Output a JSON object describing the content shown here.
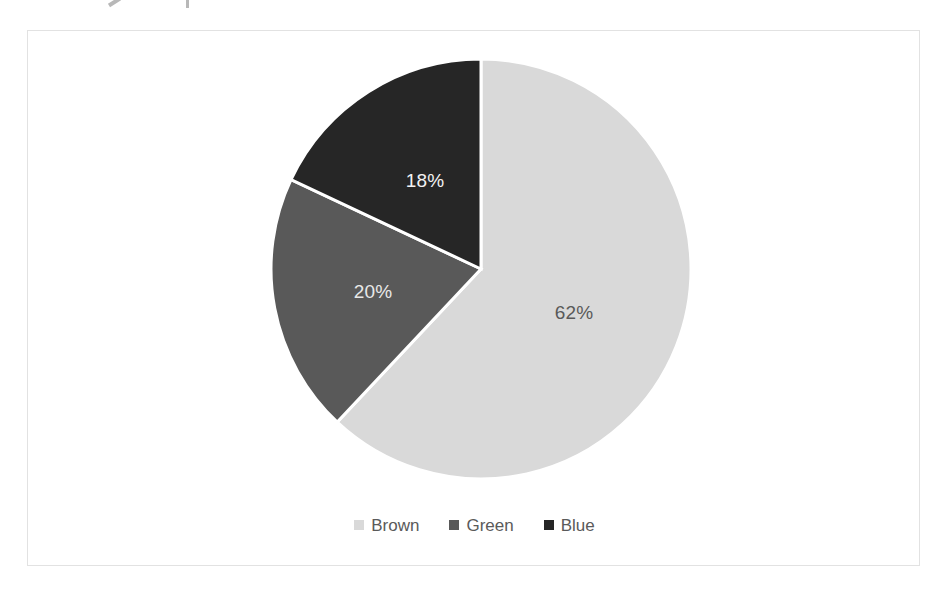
{
  "chart_data": {
    "type": "pie",
    "title": "",
    "subtitle": "",
    "xlabel": "",
    "ylabel": "",
    "legend_position": "bottom",
    "grid": false,
    "start_angle_deg": 0,
    "direction": "clockwise",
    "categories": [
      "Brown",
      "Green",
      "Blue"
    ],
    "values": [
      62,
      20,
      18
    ],
    "value_unit": "%",
    "data_labels": [
      "62%",
      "20%",
      "18%"
    ],
    "colors": [
      "#d9d9d9",
      "#595959",
      "#262626"
    ],
    "slices": [
      {
        "name": "Brown",
        "value": 62,
        "label": "62%",
        "color": "#d9d9d9",
        "label_color": "#595959",
        "start_deg": 0,
        "end_deg": 223.2,
        "label_x": 573,
        "label_y": 312
      },
      {
        "name": "Green",
        "value": 20,
        "label": "20%",
        "color": "#595959",
        "label_color": "#e8e8e8",
        "start_deg": 223.2,
        "end_deg": 295.2,
        "label_x": 372,
        "label_y": 291
      },
      {
        "name": "Blue",
        "value": 18,
        "label": "18%",
        "color": "#262626",
        "label_color": "#f2f2f2",
        "start_deg": 295.2,
        "end_deg": 360,
        "label_x": 424,
        "label_y": 180
      }
    ]
  },
  "chart": {
    "plot_background": "#ffffff",
    "border_color": "#e2e2e2",
    "slice_separator_color": "#ffffff"
  },
  "legend": {
    "entries": [
      {
        "label": "Brown",
        "color": "#d9d9d9"
      },
      {
        "label": "Green",
        "color": "#595959"
      },
      {
        "label": "Blue",
        "color": "#262626"
      }
    ]
  }
}
